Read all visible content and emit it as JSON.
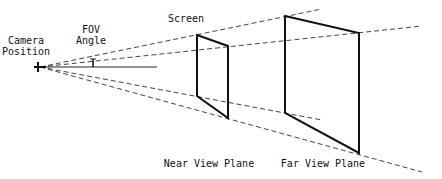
{
  "labels": {
    "camera_line1": "Camera",
    "camera_line2": "Position",
    "fov_line1": "FOV",
    "fov_line2": "Angle",
    "screen": "Screen",
    "near_plane": "Near View Plane",
    "far_plane": "Far View Plane"
  },
  "colors": {
    "line": "#111111",
    "dash": "#444444",
    "background": "#ffffff"
  }
}
